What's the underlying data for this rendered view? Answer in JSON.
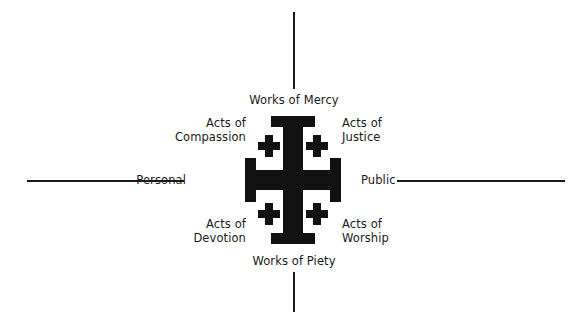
{
  "diagram": {
    "colors": {
      "ink": "#1a1a1a",
      "background": "#ffffff"
    },
    "axes": {
      "vertical_top_label": "Works of Mercy",
      "vertical_bottom_label": "Works of Piety",
      "horizontal_left_label": "Personal",
      "horizontal_right_label": "Public"
    },
    "quadrants": [
      {
        "position": "top-left",
        "line1": "Acts of",
        "line2": "Compassion"
      },
      {
        "position": "top-right",
        "line1": "Acts of",
        "line2": "Justice"
      },
      {
        "position": "bottom-left",
        "line1": "Acts of",
        "line2": "Devotion"
      },
      {
        "position": "bottom-right",
        "line1": "Acts of",
        "line2": "Worship"
      }
    ]
  }
}
